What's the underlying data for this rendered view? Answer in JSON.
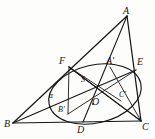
{
  "figure": {
    "type": "geometry-diagram",
    "width": 155,
    "height": 139,
    "background_color": "#fdfdfc",
    "stroke_color": "#161616",
    "label_color": "#161616",
    "points": {
      "A": {
        "label": "A",
        "x": 127,
        "y": 16,
        "label_x": 123,
        "label_y": 6
      },
      "B": {
        "label": "B",
        "x": 13,
        "y": 123,
        "label_x": 4,
        "label_y": 119
      },
      "C": {
        "label": "C",
        "x": 141,
        "y": 121,
        "label_x": 141,
        "label_y": 122
      },
      "D": {
        "label": "D",
        "x": 83,
        "y": 122,
        "label_x": 77,
        "label_y": 124
      },
      "E": {
        "label": "E",
        "x": 136,
        "y": 70,
        "label_x": 137,
        "label_y": 58
      },
      "F": {
        "label": "F",
        "x": 69,
        "y": 67,
        "label_x": 60,
        "label_y": 57
      },
      "A2": {
        "label": "A'",
        "x": 110,
        "y": 67,
        "label_x": 106,
        "label_y": 57
      },
      "B2": {
        "label": "B'",
        "x": 68,
        "y": 114,
        "label_x": 58,
        "label_y": 106
      },
      "C2": {
        "label": "C'",
        "x": 121,
        "y": 101,
        "label_x": 119,
        "label_y": 92
      },
      "O": {
        "label": "O",
        "x": 93,
        "y": 104,
        "label_x": 92,
        "label_y": 97
      },
      "S": {
        "label": "S",
        "x": 86,
        "y": 86,
        "label_x": 81,
        "label_y": 77
      }
    },
    "angle_label": {
      "text": "α",
      "x": 50,
      "y": 95
    },
    "triangle_sides": [
      {
        "name": "side-AB",
        "from": "A",
        "to": "B"
      },
      {
        "name": "side-BC",
        "from": "B",
        "to": "C"
      },
      {
        "name": "side-CA",
        "from": "C",
        "to": "A"
      }
    ],
    "cevians": [
      {
        "name": "cevian-A-D",
        "from": "A",
        "to": "D"
      },
      {
        "name": "cevian-B-E",
        "from": "B",
        "to": "E"
      },
      {
        "name": "cevian-C-F",
        "from": "C",
        "to": "F"
      }
    ],
    "chords": [
      {
        "name": "chord-F-C2",
        "from": "F",
        "to": "C2"
      },
      {
        "name": "chord-B2-A2",
        "from": "B2",
        "to": "A2"
      },
      {
        "name": "chord-A2-C2",
        "from": "A2",
        "to": "C2"
      },
      {
        "name": "chord-F-B2",
        "from": "F",
        "to": "B2"
      }
    ],
    "ellipse": {
      "name": "inscribed-ellipse",
      "cx": 95,
      "cy": 94,
      "rx": 47,
      "ry": 29,
      "rotation_deg": -13
    }
  }
}
